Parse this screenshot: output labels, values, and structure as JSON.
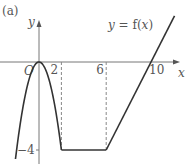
{
  "chart_data": {
    "type": "line",
    "panel_label": "(a)",
    "function_label": "y = f(x)",
    "axis_labels": {
      "x": "x",
      "y": "y",
      "origin": "O"
    },
    "x_ticks": [
      {
        "value": 2,
        "label": "2"
      },
      {
        "value": 6,
        "label": "6"
      },
      {
        "value": 10,
        "label": "10"
      }
    ],
    "y_ticks": [
      {
        "value": -4,
        "label": "−4"
      }
    ],
    "xlim": [
      -2.6,
      12.8
    ],
    "ylim": [
      -4.5,
      2.8
    ],
    "segments": [
      {
        "name": "parabola",
        "kind": "quadratic",
        "formula": "y = -x^2",
        "x_range": [
          -2.1,
          2
        ]
      },
      {
        "name": "flat",
        "kind": "line",
        "points": [
          [
            2,
            -4
          ],
          [
            6,
            -4
          ]
        ]
      },
      {
        "name": "rising",
        "kind": "line",
        "points": [
          [
            6,
            -4
          ],
          [
            12.1,
            2.1
          ]
        ]
      }
    ],
    "dashed_guides": [
      {
        "x": 2,
        "from_y": 0,
        "to_y": -4
      },
      {
        "x": 6,
        "from_y": 0,
        "to_y": -4
      }
    ],
    "colors": {
      "curve": "#333333",
      "axis": "#666666",
      "guide": "#888888",
      "text": "#555555"
    }
  }
}
